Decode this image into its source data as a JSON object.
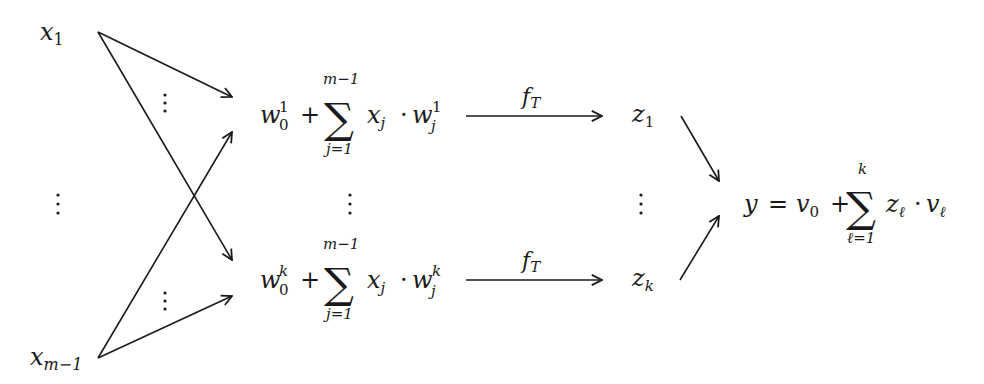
{
  "inputs": {
    "first": {
      "base": "x",
      "sub": "1"
    },
    "last": {
      "base": "x",
      "sub": "m−1"
    }
  },
  "hidden_units": [
    {
      "bias": {
        "base": "w",
        "sub": "0",
        "sup": "1"
      },
      "plus": "+",
      "sum_symbol": "∑",
      "sum_upper": "m−1",
      "sum_lower": "j=1",
      "term_x": {
        "base": "x",
        "sub": "j"
      },
      "dot": "·",
      "term_w": {
        "base": "w",
        "sub": "j",
        "sup": "1"
      }
    },
    {
      "bias": {
        "base": "w",
        "sub": "0",
        "sup": "k"
      },
      "plus": "+",
      "sum_symbol": "∑",
      "sum_upper": "m−1",
      "sum_lower": "j=1",
      "term_x": {
        "base": "x",
        "sub": "j"
      },
      "dot": "·",
      "term_w": {
        "base": "w",
        "sub": "j",
        "sup": "k"
      }
    }
  ],
  "activation": {
    "base": "f",
    "sub": "T"
  },
  "outputs_hidden": [
    {
      "base": "z",
      "sub": "1"
    },
    {
      "base": "z",
      "sub": "k"
    }
  ],
  "output": {
    "lhs": "y",
    "eq": "=",
    "bias": {
      "base": "v",
      "sub": "0"
    },
    "plus": "+",
    "sum_symbol": "∑",
    "sum_upper": "k",
    "sum_lower": "ℓ=1",
    "term_z": {
      "base": "z",
      "sub": "ℓ"
    },
    "dot": "·",
    "term_v": {
      "base": "v",
      "sub": "ℓ"
    }
  },
  "ellipsis": "⋮"
}
